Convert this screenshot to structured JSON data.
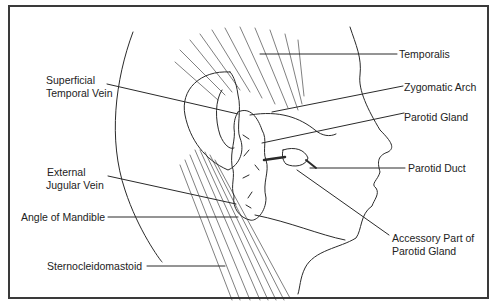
{
  "diagram": {
    "labels": {
      "temporalis": "Temporalis",
      "zygomatic_arch": "Zygomatic Arch",
      "parotid_gland": "Parotid Gland",
      "parotid_duct": "Parotid Duct",
      "accessory_line1": "Accessory Part of",
      "accessory_line2": "Parotid Gland",
      "superficial_line1": "Superficial",
      "superficial_line2": "Temporal Vein",
      "external_line1": "External",
      "external_line2": "Jugular Vein",
      "angle_of_mandible": "Angle of Mandible",
      "sternocleidomastoid": "Sternocleidomastoid"
    },
    "colors": {
      "line": "#2a2a2a",
      "frame": "#3a3a3a",
      "background": "#ffffff"
    }
  }
}
